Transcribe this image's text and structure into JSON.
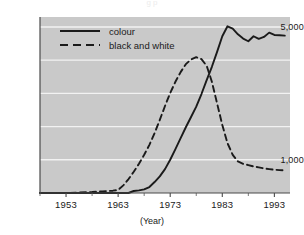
{
  "figure": {
    "cropped_caption": "g p",
    "background_color": "#ffffff",
    "plot_background_color": "#c9c9c9",
    "gridline_color": "#f2f2f2",
    "line_color": "#1a1a1a"
  },
  "legend": {
    "position": "top-left-inside",
    "entries": [
      {
        "label": "colour",
        "style": "solid",
        "icon": "solid-line-icon"
      },
      {
        "label": "black and white",
        "style": "dashed",
        "icon": "dashed-line-icon"
      }
    ]
  },
  "axes": {
    "x": {
      "title": "(Year)",
      "tick_labels": [
        "1953",
        "1963",
        "1973",
        "1983",
        "1993"
      ],
      "tick_values": [
        1953,
        1963,
        1973,
        1983,
        1993
      ],
      "range": [
        1948,
        1996
      ]
    },
    "y": {
      "title": "",
      "tick_labels": [
        "1,000",
        "5,000"
      ],
      "tick_values": [
        1000,
        5000
      ],
      "range": [
        0,
        5300
      ],
      "gridlines": [
        1000,
        2000,
        3000,
        4000,
        5000
      ]
    }
  },
  "chart_data": {
    "type": "line",
    "title": "",
    "subtitle": "",
    "xlabel": "(Year)",
    "ylabel": "",
    "xlim": [
      1948,
      1996
    ],
    "ylim": [
      0,
      5300
    ],
    "grid": true,
    "legend_position": "upper left",
    "x": [
      1948,
      1953,
      1958,
      1960,
      1962,
      1963,
      1964,
      1965,
      1966,
      1967,
      1968,
      1969,
      1970,
      1971,
      1972,
      1973,
      1974,
      1975,
      1976,
      1977,
      1978,
      1979,
      1980,
      1981,
      1982,
      1983,
      1984,
      1985,
      1986,
      1987,
      1988,
      1989,
      1990,
      1991,
      1992,
      1993,
      1994,
      1995
    ],
    "series": [
      {
        "name": "colour",
        "style": "solid",
        "values": [
          0,
          0,
          0,
          0,
          0,
          0,
          0,
          0,
          60,
          80,
          110,
          180,
          330,
          500,
          720,
          1000,
          1320,
          1650,
          1980,
          2290,
          2600,
          2980,
          3400,
          3800,
          4250,
          4720,
          5020,
          4950,
          4780,
          4650,
          4570,
          4720,
          4640,
          4700,
          4830,
          4760,
          4750,
          4740
        ]
      },
      {
        "name": "black and white",
        "style": "dashed",
        "values": [
          0,
          0,
          30,
          50,
          70,
          90,
          230,
          420,
          640,
          880,
          1150,
          1450,
          1800,
          2200,
          2620,
          3010,
          3350,
          3640,
          3880,
          4020,
          4090,
          4030,
          3830,
          3350,
          2700,
          2050,
          1500,
          1150,
          950,
          880,
          840,
          800,
          770,
          740,
          720,
          700,
          690,
          680
        ]
      }
    ]
  }
}
